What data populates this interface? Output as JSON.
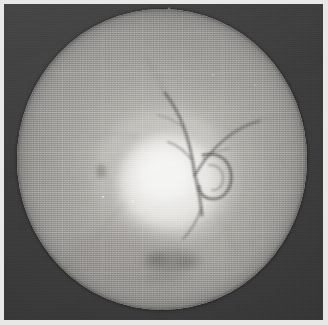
{
  "image": {
    "kind": "fundus-photograph",
    "modality": "Retinal fundus photography",
    "color_mode": "Grayscale",
    "caption": "Grayscale fundus photograph showing a circular retinal field with central bright optic disc, branching retinal vessels and a faint graticule overlay.",
    "width_px": 328,
    "height_px": 325
  },
  "frame": {
    "mount_color": "#e8e8e6",
    "background_color": "#3a3a3a",
    "background_label": "dark photographic surround"
  },
  "aperture": {
    "label": "circular retinal field",
    "center_x_px": 158,
    "center_y_px": 156,
    "radius_x_px": 145,
    "radius_y_px": 150,
    "base_color": "#a6a4a0",
    "highlight_color": "#f0efec",
    "shadow_color": "#858382"
  },
  "features": [
    {
      "name": "optic-disc",
      "label": "Optic disc (bright central region)",
      "center_x_px": 166,
      "center_y_px": 176,
      "brightness": "brightest",
      "color": "#f2f1ee"
    },
    {
      "name": "vessel-arcade-superior",
      "label": "Superior vessel arcade, Y-shaped bifurcation",
      "color": "#6f6d6b"
    },
    {
      "name": "vessel-loop",
      "label": "Looping vessel / hook near disc margin",
      "center_x_px": 205,
      "center_y_px": 172,
      "color": "#6a6866"
    },
    {
      "name": "disc-margin-arc",
      "label": "Crescent arc at disc margin",
      "color": "#8f8d8b"
    },
    {
      "name": "inferior-lesion",
      "label": "Darker inferior smudge / lesion",
      "center_x_px": 168,
      "center_y_px": 256,
      "color": "#7b7977"
    },
    {
      "name": "top-notch",
      "label": "Small pale notch at superior aperture rim",
      "center_x_px": 165,
      "center_y_px": 9
    },
    {
      "name": "left-nick",
      "label": "Small dark nick at nasal aperture rim",
      "center_x_px": 19,
      "center_y_px": 222
    }
  ],
  "overlay": {
    "graticule_label": "Faint square reticule grid",
    "graticule_spacing_px": 40,
    "graticule_opacity": 0.12,
    "grain_label": "Film / scan grain"
  }
}
